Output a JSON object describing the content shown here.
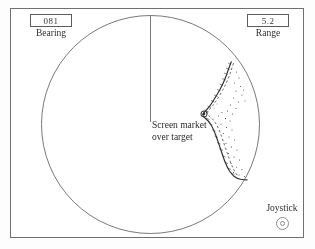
{
  "display": {
    "name": "radar-ppi-console"
  },
  "bearing": {
    "value": "081",
    "label": "Bearing"
  },
  "range": {
    "value": "5.2",
    "label": "Range"
  },
  "marker": {
    "label_line1": "Screen market",
    "label_line2": "over target",
    "icon": "target-marker-icon"
  },
  "joystick": {
    "label": "Joystick",
    "icon": "joystick-knob-icon"
  },
  "scope": {
    "heading_line": "ship-heading-line",
    "coastline": "coastline-trace",
    "bezel": "scope-circle"
  },
  "colors": {
    "ink": "#2b2b2b",
    "line": "#5c5c5c",
    "bezel": "#6f6f6f",
    "paper": "#ffffff"
  }
}
